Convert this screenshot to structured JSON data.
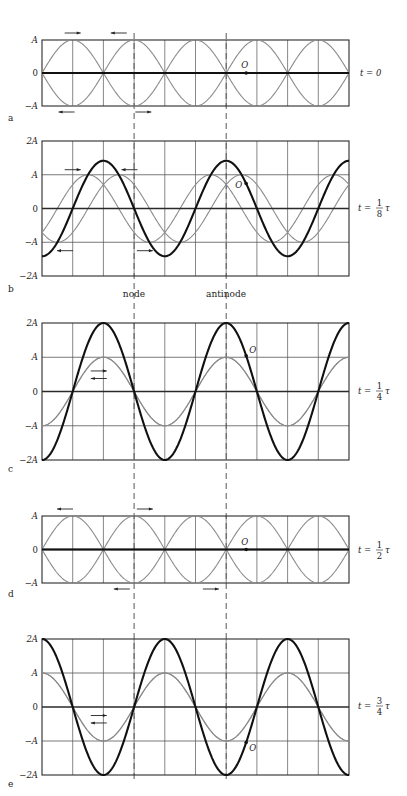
{
  "figure": {
    "columns": 10,
    "wavelength_columns": 4,
    "antinode_column": 6,
    "node_column": 3,
    "amplitude_label": "A",
    "colors": {
      "frame": "#2a2a2a",
      "grid": "#555555",
      "component_wave": "#8c8c8c",
      "resultant_wave": "#111111",
      "dashed": "#444444"
    },
    "annotations": {
      "node_label": "node",
      "antinode_label": "antinode",
      "point_label": "O"
    },
    "panels": [
      {
        "id": "a",
        "letter": "a",
        "time_label": "t = 0",
        "time_numerator": "",
        "time_denominator": "",
        "time_fraction_of_period": 0,
        "y_ticks": [
          "A",
          "0",
          "−A"
        ],
        "y_range_in_A": [
          -1,
          1
        ],
        "arrows": [
          {
            "col": 1.0,
            "level": "top",
            "dir": "right"
          },
          {
            "col": 2.5,
            "level": "top",
            "dir": "left"
          },
          {
            "col": 0.8,
            "level": "bottom",
            "dir": "left"
          },
          {
            "col": 3.3,
            "level": "bottom",
            "dir": "right"
          }
        ]
      },
      {
        "id": "b",
        "letter": "b",
        "time_label": "t =",
        "time_numerator": "1",
        "time_denominator": "8",
        "time_symbol": "τ",
        "time_fraction_of_period": 0.125,
        "y_ticks": [
          "2A",
          "A",
          "0",
          "−A",
          "−2A"
        ],
        "y_range_in_A": [
          -2,
          2
        ],
        "arrows": [
          {
            "col": 1.0,
            "level": 1.15,
            "dir": "right"
          },
          {
            "col": 2.85,
            "level": 1.15,
            "dir": "left"
          },
          {
            "col": 0.75,
            "level": -1.25,
            "dir": "left"
          },
          {
            "col": 3.35,
            "level": -1.25,
            "dir": "right"
          }
        ]
      },
      {
        "id": "c",
        "letter": "c",
        "time_label": "t =",
        "time_numerator": "1",
        "time_denominator": "4",
        "time_symbol": "τ",
        "time_fraction_of_period": 0.25,
        "y_ticks": [
          "2A",
          "A",
          "0",
          "−A",
          "−2A"
        ],
        "y_range_in_A": [
          -2,
          2
        ],
        "arrows": [
          {
            "col": 1.85,
            "level": 0.6,
            "dir": "right"
          },
          {
            "col": 1.85,
            "level": 0.38,
            "dir": "left"
          }
        ]
      },
      {
        "id": "d",
        "letter": "d",
        "time_label": "t =",
        "time_numerator": "1",
        "time_denominator": "2",
        "time_symbol": "τ",
        "time_fraction_of_period": 0.5,
        "y_ticks": [
          "A",
          "0",
          "−A"
        ],
        "y_range_in_A": [
          -1,
          1
        ],
        "arrows": [
          {
            "col": 0.75,
            "level": "top",
            "dir": "left"
          },
          {
            "col": 3.35,
            "level": "top",
            "dir": "right"
          },
          {
            "col": 2.6,
            "level": "bottom",
            "dir": "left"
          },
          {
            "col": 5.5,
            "level": "bottom",
            "dir": "right"
          }
        ]
      },
      {
        "id": "e",
        "letter": "e",
        "time_label": "t =",
        "time_numerator": "3",
        "time_denominator": "4",
        "time_symbol": "τ",
        "time_fraction_of_period": 0.75,
        "y_ticks": [
          "2A",
          "A",
          "0",
          "−A",
          "−2A"
        ],
        "y_range_in_A": [
          -2,
          2
        ],
        "arrows": [
          {
            "col": 1.85,
            "level": -0.25,
            "dir": "right"
          },
          {
            "col": 1.85,
            "level": -0.47,
            "dir": "left"
          }
        ]
      }
    ]
  }
}
